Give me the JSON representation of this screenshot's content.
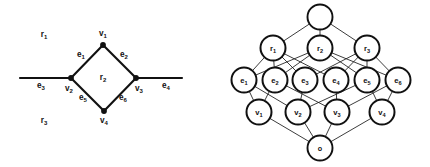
{
  "figure": {
    "width": 430,
    "height": 167,
    "background": "#ffffff",
    "ink": "#111111"
  },
  "left_panel": {
    "name": "planar-graph",
    "caption": "Planar graph with vertices, edges and faces",
    "vertices": [
      {
        "id": "v1",
        "base": "v",
        "sub": "1",
        "x": 103,
        "y": 45,
        "label_x": 103,
        "label_y": 36
      },
      {
        "id": "v2",
        "base": "v",
        "sub": "2",
        "x": 71,
        "y": 78,
        "label_x": 69,
        "label_y": 91
      },
      {
        "id": "v3",
        "base": "v",
        "sub": "3",
        "x": 136,
        "y": 78,
        "label_x": 139,
        "label_y": 91
      },
      {
        "id": "v4",
        "base": "v",
        "sub": "4",
        "x": 104,
        "y": 111,
        "label_x": 104,
        "label_y": 123
      }
    ],
    "edges": [
      {
        "id": "e1",
        "base": "e",
        "sub": "1",
        "from": "v2",
        "to": "v1",
        "label_x": 81,
        "label_y": 57
      },
      {
        "id": "e2",
        "base": "e",
        "sub": "2",
        "from": "v1",
        "to": "v3",
        "label_x": 124,
        "label_y": 57
      },
      {
        "id": "e3",
        "base": "e",
        "sub": "3",
        "from": "x20",
        "to": "v2",
        "label_x": 41,
        "label_y": 88
      },
      {
        "id": "e4",
        "base": "e",
        "sub": "4",
        "from": "v3",
        "to": "x182",
        "label_x": 166,
        "label_y": 88
      },
      {
        "id": "e5",
        "base": "e",
        "sub": "5",
        "from": "v2",
        "to": "v4",
        "label_x": 83,
        "label_y": 100
      },
      {
        "id": "e6",
        "base": "e",
        "sub": "6",
        "from": "v4",
        "to": "v3",
        "label_x": 123,
        "label_y": 100
      }
    ],
    "faces": [
      {
        "id": "r1",
        "base": "r",
        "sub": "1",
        "label_x": 44,
        "label_y": 37
      },
      {
        "id": "r2",
        "base": "r",
        "sub": "2",
        "label_x": 103,
        "label_y": 80
      },
      {
        "id": "r3",
        "base": "r",
        "sub": "3",
        "label_x": 44,
        "label_y": 123
      }
    ],
    "open_edge_endpoints": {
      "left_x": 20,
      "right_x": 182,
      "y": 78
    }
  },
  "right_panel": {
    "name": "incidence-lattice",
    "caption": "Hasse diagram of the face-edge-vertex incidence lattice",
    "levels": [
      {
        "name": "top-level",
        "nodes": [
          {
            "id": "top",
            "base": "",
            "sub": "",
            "x": 320,
            "y": 17,
            "r": 12.5
          }
        ]
      },
      {
        "name": "face-level",
        "nodes": [
          {
            "id": "r1",
            "base": "r",
            "sub": "1",
            "x": 273,
            "y": 48,
            "r": 12.5
          },
          {
            "id": "r2",
            "base": "r",
            "sub": "2",
            "x": 320,
            "y": 48,
            "r": 12.5
          },
          {
            "id": "r3",
            "base": "r",
            "sub": "3",
            "x": 367,
            "y": 48,
            "r": 12.5
          }
        ]
      },
      {
        "name": "edge-level",
        "nodes": [
          {
            "id": "e1",
            "base": "e",
            "sub": "1",
            "x": 244,
            "y": 80,
            "r": 12.5
          },
          {
            "id": "e2",
            "base": "e",
            "sub": "2",
            "x": 275,
            "y": 80,
            "r": 12.5
          },
          {
            "id": "e3",
            "base": "e",
            "sub": "3",
            "x": 305,
            "y": 80,
            "r": 12.5
          },
          {
            "id": "e4",
            "base": "e",
            "sub": "4",
            "x": 336,
            "y": 80,
            "r": 12.5
          },
          {
            "id": "e5",
            "base": "e",
            "sub": "5",
            "x": 367,
            "y": 80,
            "r": 12.5
          },
          {
            "id": "e6",
            "base": "e",
            "sub": "6",
            "x": 398,
            "y": 80,
            "r": 12.5
          }
        ]
      },
      {
        "name": "vertex-level",
        "nodes": [
          {
            "id": "v1",
            "base": "v",
            "sub": "1",
            "x": 259,
            "y": 112,
            "r": 12.5
          },
          {
            "id": "v2",
            "base": "v",
            "sub": "2",
            "x": 298,
            "y": 112,
            "r": 12.5
          },
          {
            "id": "v3",
            "base": "v",
            "sub": "3",
            "x": 337,
            "y": 112,
            "r": 12.5
          },
          {
            "id": "v4",
            "base": "v",
            "sub": "4",
            "x": 382,
            "y": 112,
            "r": 12.5
          }
        ]
      },
      {
        "name": "bottom-level",
        "nodes": [
          {
            "id": "zero",
            "base": "o",
            "sub": "",
            "x": 320,
            "y": 148,
            "r": 12.5
          }
        ]
      }
    ],
    "links": [
      {
        "from": "top",
        "to": "r1"
      },
      {
        "from": "top",
        "to": "r2"
      },
      {
        "from": "top",
        "to": "r3"
      },
      {
        "from": "r1",
        "to": "e1"
      },
      {
        "from": "r1",
        "to": "e2"
      },
      {
        "from": "r1",
        "to": "e3"
      },
      {
        "from": "r1",
        "to": "e4"
      },
      {
        "from": "r2",
        "to": "e1"
      },
      {
        "from": "r2",
        "to": "e2"
      },
      {
        "from": "r2",
        "to": "e5"
      },
      {
        "from": "r2",
        "to": "e6"
      },
      {
        "from": "r3",
        "to": "e3"
      },
      {
        "from": "r3",
        "to": "e4"
      },
      {
        "from": "r3",
        "to": "e5"
      },
      {
        "from": "r3",
        "to": "e6"
      },
      {
        "from": "e1",
        "to": "v1"
      },
      {
        "from": "e1",
        "to": "v2"
      },
      {
        "from": "e2",
        "to": "v1"
      },
      {
        "from": "e2",
        "to": "v3"
      },
      {
        "from": "e3",
        "to": "v2"
      },
      {
        "from": "e4",
        "to": "v3"
      },
      {
        "from": "e5",
        "to": "v2"
      },
      {
        "from": "e5",
        "to": "v4"
      },
      {
        "from": "e6",
        "to": "v3"
      },
      {
        "from": "e6",
        "to": "v4"
      },
      {
        "from": "v1",
        "to": "zero"
      },
      {
        "from": "v2",
        "to": "zero"
      },
      {
        "from": "v3",
        "to": "zero"
      },
      {
        "from": "v4",
        "to": "zero"
      }
    ]
  }
}
